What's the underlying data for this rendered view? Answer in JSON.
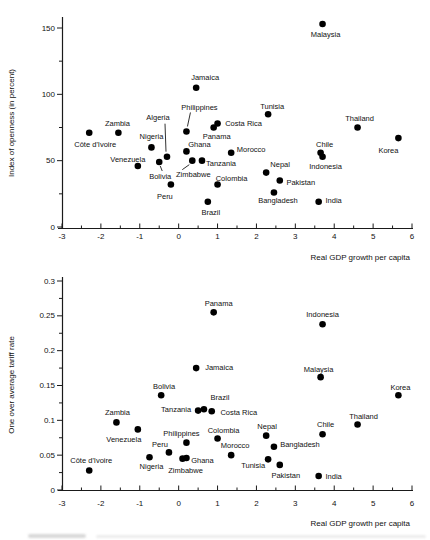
{
  "figure": {
    "background": "#ffffff",
    "dot_color": "#000000",
    "axis_color": "#1a1a1a",
    "text_color": "#111111"
  },
  "chart_data": [
    {
      "type": "scatter",
      "title": "",
      "xlabel": "Real GDP growth per capita",
      "ylabel": "Index of openness (in percent)",
      "xlim": [
        -3,
        6
      ],
      "ylim": [
        0,
        160
      ],
      "grid": false,
      "legend": "none",
      "x_ticks": [
        -3,
        -2,
        -1,
        0,
        1,
        2,
        3,
        4,
        5,
        6
      ],
      "x_tick_labels": [
        "-3",
        "-2",
        "-1",
        "0",
        "1",
        "2",
        "3",
        "4",
        "5",
        "6"
      ],
      "y_ticks": [
        0,
        50,
        100,
        150
      ],
      "y_tick_labels": [
        "0",
        "50",
        "100",
        "150"
      ],
      "points": [
        {
          "name": "Côte d'Ivoire",
          "x": -2.3,
          "y": 71,
          "ldx": 6,
          "ldy": 12
        },
        {
          "name": "Zambia",
          "x": -1.55,
          "y": 71,
          "ldx": -1,
          "ldy": -9
        },
        {
          "name": "Venezuela",
          "x": -1.05,
          "y": 46,
          "ldx": -10,
          "ldy": -7
        },
        {
          "name": "Nigeria",
          "x": -0.7,
          "y": 60,
          "ldx": 0,
          "ldy": -11
        },
        {
          "name": "Bolivia",
          "x": -0.5,
          "y": 49,
          "ldx": 1,
          "ldy": 14,
          "leader": [
            3,
            9,
            1,
            4
          ]
        },
        {
          "name": "Algeria",
          "x": -0.3,
          "y": 53,
          "ldx": -9,
          "ldy": -39,
          "leader": [
            -2,
            -33,
            -1,
            -5
          ]
        },
        {
          "name": "Peru",
          "x": -0.2,
          "y": 32,
          "ldx": -6,
          "ldy": 12
        },
        {
          "name": "Philippines",
          "x": 0.2,
          "y": 72,
          "ldx": 13,
          "ldy": -24,
          "leader": [
            4,
            -19,
            1,
            -5
          ]
        },
        {
          "name": "Ghana",
          "x": 0.2,
          "y": 57,
          "ldx": 13,
          "ldy": -7
        },
        {
          "name": "Zimbabwe",
          "x": 0.35,
          "y": 50,
          "ldx": 1,
          "ldy": 14,
          "leader": [
            -10,
            9,
            -3,
            4
          ]
        },
        {
          "name": "Jamaica",
          "x": 0.45,
          "y": 105,
          "ldx": 9,
          "ldy": -10
        },
        {
          "name": "Tanzania",
          "x": 0.6,
          "y": 50,
          "ldx": 19,
          "ldy": 3
        },
        {
          "name": "Brazil",
          "x": 0.75,
          "y": 19,
          "ldx": 3,
          "ldy": 11
        },
        {
          "name": "Panama",
          "x": 0.9,
          "y": 75,
          "ldx": 3,
          "ldy": 9
        },
        {
          "name": "Costa Rica",
          "x": 1.0,
          "y": 78,
          "ldx": 26,
          "ldy": 0
        },
        {
          "name": "Colombia",
          "x": 1.0,
          "y": 32,
          "ldx": 14,
          "ldy": -6
        },
        {
          "name": "Morocco",
          "x": 1.35,
          "y": 56,
          "ldx": 20,
          "ldy": -3
        },
        {
          "name": "Nepal",
          "x": 2.25,
          "y": 41,
          "ldx": 14,
          "ldy": -8
        },
        {
          "name": "Tunisia",
          "x": 2.3,
          "y": 85,
          "ldx": 4,
          "ldy": -8
        },
        {
          "name": "Bangladesh",
          "x": 2.45,
          "y": 26,
          "ldx": 4,
          "ldy": 8
        },
        {
          "name": "Pakistan",
          "x": 2.6,
          "y": 35,
          "ldx": 21,
          "ldy": 2
        },
        {
          "name": "India",
          "x": 3.6,
          "y": 19,
          "ldx": 15,
          "ldy": -1
        },
        {
          "name": "Chile",
          "x": 3.65,
          "y": 56,
          "ldx": 4,
          "ldy": -8
        },
        {
          "name": "Indonesia",
          "x": 3.7,
          "y": 53,
          "ldx": 3,
          "ldy": 10
        },
        {
          "name": "Malaysia",
          "x": 3.7,
          "y": 153,
          "ldx": 3,
          "ldy": 10
        },
        {
          "name": "Thailand",
          "x": 4.6,
          "y": 75,
          "ldx": 2,
          "ldy": -9
        },
        {
          "name": "Korea",
          "x": 5.65,
          "y": 67,
          "ldx": -10,
          "ldy": 12
        }
      ]
    },
    {
      "type": "scatter",
      "title": "",
      "xlabel": "Real GDP growth per capita",
      "ylabel": "One over average tariff rate",
      "xlim": [
        -3,
        6
      ],
      "ylim": [
        0,
        0.3
      ],
      "grid": false,
      "legend": "none",
      "x_ticks": [
        -3,
        -2,
        -1,
        0,
        1,
        2,
        3,
        4,
        5,
        6
      ],
      "x_tick_labels": [
        "-3",
        "-2",
        "-1",
        "0",
        "1",
        "2",
        "3",
        "4",
        "5",
        "6"
      ],
      "y_ticks": [
        0,
        0.05,
        0.1,
        0.15,
        0.2,
        0.25,
        0.3
      ],
      "y_tick_labels": [
        "0",
        "0.05",
        "0.1",
        "0.15",
        "0.2",
        "0.25",
        "0.3"
      ],
      "points": [
        {
          "name": "Côte d'Ivoire",
          "x": -2.3,
          "y": 0.028,
          "ldx": 2,
          "ldy": -10
        },
        {
          "name": "Zambia",
          "x": -1.6,
          "y": 0.097,
          "ldx": 1,
          "ldy": -10
        },
        {
          "name": "Venezuela",
          "x": -1.05,
          "y": 0.087,
          "ldx": -14,
          "ldy": 10
        },
        {
          "name": "Nigeria",
          "x": -0.75,
          "y": 0.047,
          "ldx": 2,
          "ldy": 9
        },
        {
          "name": "Bolivia",
          "x": -0.45,
          "y": 0.136,
          "ldx": 3,
          "ldy": -9
        },
        {
          "name": "Peru",
          "x": -0.25,
          "y": 0.054,
          "ldx": -9,
          "ldy": -8
        },
        {
          "name": "Zimbabwe",
          "x": 0.1,
          "y": 0.045,
          "ldx": 3,
          "ldy": 12
        },
        {
          "name": "Philippines",
          "x": 0.2,
          "y": 0.068,
          "ldx": -5,
          "ldy": -9
        },
        {
          "name": "Ghana",
          "x": 0.2,
          "y": 0.046,
          "ldx": 16,
          "ldy": 2
        },
        {
          "name": "Jamaica",
          "x": 0.45,
          "y": 0.175,
          "ldx": 23,
          "ldy": -1
        },
        {
          "name": "Tanzania",
          "x": 0.5,
          "y": 0.114,
          "ldx": -22,
          "ldy": -1
        },
        {
          "name": "Brazil",
          "x": 0.65,
          "y": 0.116,
          "ldx": 16,
          "ldy": -12
        },
        {
          "name": "Costa Rica",
          "x": 0.85,
          "y": 0.113,
          "ldx": 27,
          "ldy": 1
        },
        {
          "name": "Panama",
          "x": 0.9,
          "y": 0.255,
          "ldx": 5,
          "ldy": -9
        },
        {
          "name": "Colombia",
          "x": 1.0,
          "y": 0.074,
          "ldx": 6,
          "ldy": -8
        },
        {
          "name": "Morocco",
          "x": 1.35,
          "y": 0.05,
          "ldx": 4,
          "ldy": -10
        },
        {
          "name": "Nepal",
          "x": 2.25,
          "y": 0.078,
          "ldx": 1,
          "ldy": -9
        },
        {
          "name": "Tunisia",
          "x": 2.3,
          "y": 0.044,
          "ldx": -15,
          "ldy": 6
        },
        {
          "name": "Bangladesh",
          "x": 2.45,
          "y": 0.062,
          "ldx": 26,
          "ldy": -2
        },
        {
          "name": "Pakistan",
          "x": 2.6,
          "y": 0.036,
          "ldx": 6,
          "ldy": 10
        },
        {
          "name": "India",
          "x": 3.6,
          "y": 0.02,
          "ldx": 15,
          "ldy": 0
        },
        {
          "name": "Malaysia",
          "x": 3.65,
          "y": 0.162,
          "ldx": -2,
          "ldy": -8
        },
        {
          "name": "Chile",
          "x": 3.7,
          "y": 0.08,
          "ldx": 3,
          "ldy": -10
        },
        {
          "name": "Indonesia",
          "x": 3.7,
          "y": 0.238,
          "ldx": 0,
          "ldy": -10
        },
        {
          "name": "Thailand",
          "x": 4.6,
          "y": 0.094,
          "ldx": 6,
          "ldy": -8
        },
        {
          "name": "Korea",
          "x": 5.65,
          "y": 0.136,
          "ldx": 2,
          "ldy": -8
        }
      ]
    }
  ]
}
